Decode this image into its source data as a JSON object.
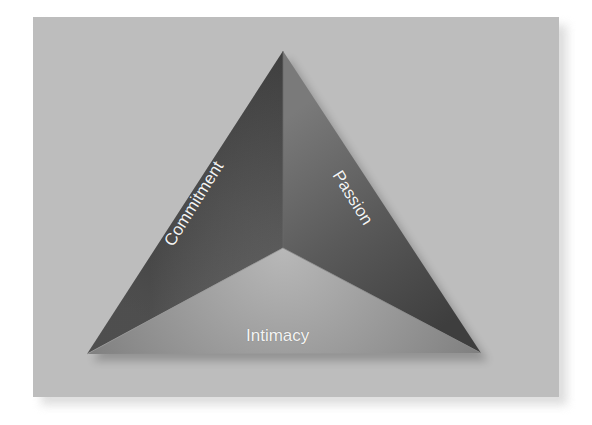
{
  "diagram": {
    "type": "triangle",
    "faces": [
      {
        "id": "commitment",
        "label": "Commitment",
        "position": "left"
      },
      {
        "id": "passion",
        "label": "Passion",
        "position": "right"
      },
      {
        "id": "intimacy",
        "label": "Intimacy",
        "position": "bottom"
      }
    ],
    "colors": {
      "background_panel": "#bdbdbd",
      "left_face_dark": "#3a3a3a",
      "right_face_dark": "#454545",
      "bottom_face_light": "#a8a8a8",
      "label_text": "#f4f4f4"
    }
  }
}
